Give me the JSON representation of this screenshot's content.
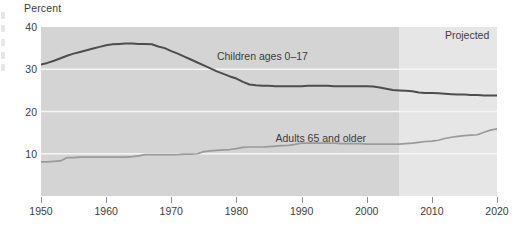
{
  "chart_data": {
    "type": "line",
    "title": "",
    "ylabel": "Percent",
    "xlabel": "",
    "ylim": [
      0,
      40
    ],
    "xlim": [
      1950,
      2020
    ],
    "grid": true,
    "grid_color": "#f2f2f2",
    "legend_position": "inline-annotation",
    "y_ticks": [
      40,
      30,
      20,
      10
    ],
    "x_ticks": [
      1950,
      1960,
      1970,
      1980,
      1990,
      2000,
      2010,
      2020
    ],
    "annotations": [
      {
        "name": "projected-label",
        "text": "Projected",
        "x": 2012,
        "y": 38
      },
      {
        "name": "children-series-label",
        "text": "Children ages 0–17",
        "x": 1977,
        "y": 33.2
      },
      {
        "name": "adults-series-label",
        "text": "Adults 65 and older",
        "x": 1986,
        "y": 13.8
      }
    ],
    "projection_start_year": 2005,
    "colors": {
      "children_line": "#4d4d4d",
      "adults_line": "#9a9a9a",
      "historic_band": "#d4d4d4",
      "projected_band": "#e6e6e6",
      "gridline": "#f5f5f5",
      "text": "#3c3c3c"
    },
    "series": [
      {
        "name": "Children ages 0–17",
        "color": "#4d4d4d",
        "x": [
          1950,
          1951,
          1952,
          1953,
          1954,
          1955,
          1956,
          1957,
          1958,
          1959,
          1960,
          1961,
          1962,
          1963,
          1964,
          1965,
          1966,
          1967,
          1968,
          1969,
          1970,
          1971,
          1972,
          1973,
          1974,
          1975,
          1976,
          1977,
          1978,
          1979,
          1980,
          1981,
          1982,
          1983,
          1984,
          1985,
          1986,
          1987,
          1988,
          1989,
          1990,
          1991,
          1992,
          1993,
          1994,
          1995,
          1996,
          1997,
          1998,
          1999,
          2000,
          2001,
          2002,
          2003,
          2004,
          2005,
          2006,
          2007,
          2008,
          2009,
          2010,
          2011,
          2012,
          2013,
          2014,
          2015,
          2016,
          2017,
          2018,
          2019,
          2020
        ],
        "values": [
          31.1,
          31.5,
          32.0,
          32.6,
          33.2,
          33.7,
          34.1,
          34.5,
          34.9,
          35.3,
          35.7,
          35.9,
          36.0,
          36.1,
          36.1,
          36.0,
          36.0,
          35.9,
          35.4,
          35.0,
          34.3,
          33.7,
          33.0,
          32.3,
          31.6,
          30.9,
          30.2,
          29.5,
          28.9,
          28.3,
          27.8,
          27.0,
          26.4,
          26.2,
          26.1,
          26.1,
          26.0,
          26.0,
          26.0,
          26.0,
          26.0,
          26.1,
          26.1,
          26.1,
          26.1,
          26.0,
          26.0,
          26.0,
          26.0,
          26.0,
          26.0,
          25.9,
          25.7,
          25.4,
          25.1,
          25.0,
          24.9,
          24.8,
          24.5,
          24.4,
          24.4,
          24.3,
          24.2,
          24.1,
          24.0,
          24.0,
          23.9,
          23.9,
          23.8,
          23.8,
          23.8
        ]
      },
      {
        "name": "Adults 65 and older",
        "color": "#9a9a9a",
        "x": [
          1950,
          1951,
          1952,
          1953,
          1954,
          1955,
          1956,
          1957,
          1958,
          1959,
          1960,
          1961,
          1962,
          1963,
          1964,
          1965,
          1966,
          1967,
          1968,
          1969,
          1970,
          1971,
          1972,
          1973,
          1974,
          1975,
          1976,
          1977,
          1978,
          1979,
          1980,
          1981,
          1982,
          1983,
          1984,
          1985,
          1986,
          1987,
          1988,
          1989,
          1990,
          1991,
          1992,
          1993,
          1994,
          1995,
          1996,
          1997,
          1998,
          1999,
          2000,
          2001,
          2002,
          2003,
          2004,
          2005,
          2006,
          2007,
          2008,
          2009,
          2010,
          2011,
          2012,
          2013,
          2014,
          2015,
          2016,
          2017,
          2018,
          2019,
          2020
        ],
        "values": [
          8.1,
          8.1,
          8.2,
          8.3,
          9.1,
          9.1,
          9.2,
          9.2,
          9.2,
          9.2,
          9.2,
          9.2,
          9.2,
          9.2,
          9.3,
          9.5,
          9.8,
          9.8,
          9.8,
          9.8,
          9.8,
          9.8,
          9.9,
          9.9,
          10.0,
          10.5,
          10.7,
          10.8,
          10.9,
          11.0,
          11.2,
          11.5,
          11.6,
          11.6,
          11.6,
          11.7,
          11.8,
          11.9,
          12.0,
          12.2,
          12.5,
          12.5,
          12.5,
          12.5,
          12.5,
          12.5,
          12.4,
          12.4,
          12.4,
          12.4,
          12.3,
          12.3,
          12.3,
          12.3,
          12.3,
          12.3,
          12.4,
          12.5,
          12.7,
          12.9,
          13.0,
          13.2,
          13.6,
          13.9,
          14.1,
          14.3,
          14.4,
          14.5,
          15.1,
          15.6,
          15.9
        ]
      }
    ]
  }
}
